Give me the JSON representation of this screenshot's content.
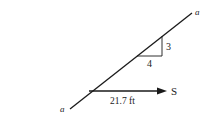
{
  "diagram": {
    "line_label_start": "a",
    "line_label_end": "a",
    "slope_rise": "3",
    "slope_run": "4",
    "vector_label": "S",
    "distance_label": "21.7 ft",
    "colors": {
      "stroke": "#1a1a1a",
      "background": "#ffffff"
    }
  }
}
